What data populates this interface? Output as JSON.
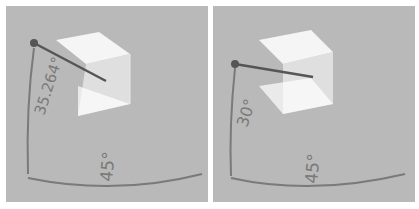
{
  "panels": [
    {
      "id": "isometric",
      "elevation_label": "35.264°",
      "azimuth_label": "45°"
    },
    {
      "id": "dimetric",
      "elevation_label": "30°",
      "azimuth_label": "45°"
    }
  ],
  "colors": {
    "background": "#b9b9b9",
    "cube_face": "#ffffff",
    "arc": "#7a7a7a",
    "view_line": "#555555"
  }
}
